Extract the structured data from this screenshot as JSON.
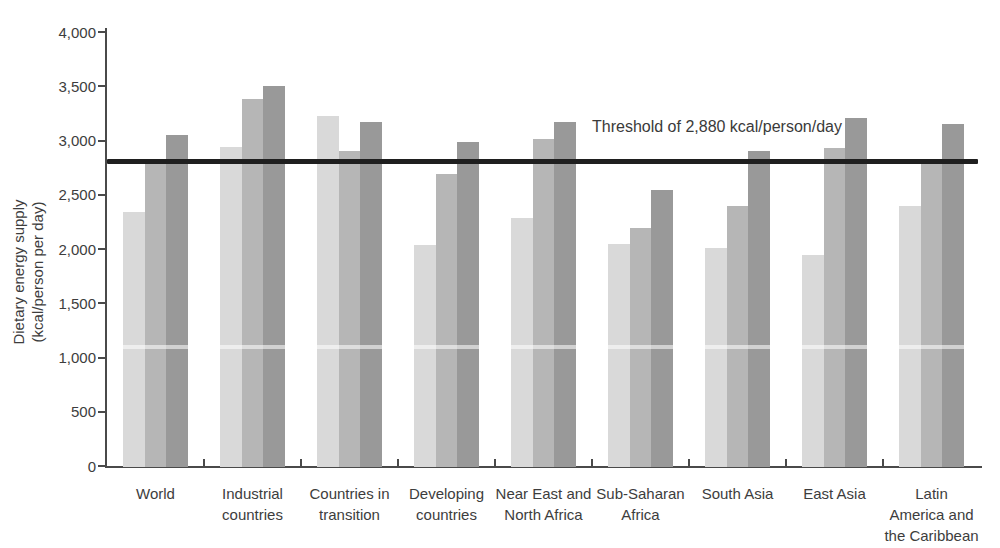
{
  "chart_data": {
    "type": "bar",
    "title": "",
    "xlabel": "",
    "ylabel_lines": [
      "Dietary energy supply",
      "(kcal/person per day)"
    ],
    "ylim": [
      0,
      4000
    ],
    "ytick_step": 500,
    "ytick_labels": [
      "0",
      "500",
      "1,000",
      "1,500",
      "2,000",
      "2,500",
      "3,000",
      "3,500",
      "4,000"
    ],
    "grid": false,
    "legend_position": "none",
    "categories": [
      "World",
      "Industrial\ncountries",
      "Countries in\ntransition",
      "Developing\ncountries",
      "Near East and\nNorth Africa",
      "Sub-Saharan\nAfrica",
      "South Asia",
      "East Asia",
      "Latin\nAmerica and\nthe Caribbean"
    ],
    "series": [
      {
        "name": "series-1-light-gray",
        "color": "#d9d9d9",
        "values": [
          2340,
          2940,
          3230,
          2040,
          2290,
          2050,
          2010,
          1945,
          2395
        ]
      },
      {
        "name": "series-2-medium-gray",
        "color": "#b6b6b6",
        "values": [
          2800,
          3380,
          2900,
          2690,
          3010,
          2190,
          2400,
          2930,
          2820
        ]
      },
      {
        "name": "series-3-dark-gray",
        "color": "#999999",
        "values": [
          3050,
          3500,
          3175,
          2985,
          3170,
          2540,
          2905,
          3210,
          3155
        ]
      }
    ],
    "threshold": {
      "label": "Threshold of 2,880 kcal/person/day",
      "value": 2880,
      "line_value_as_drawn": 2805,
      "line_color": "#1f1f1f"
    },
    "colors": {
      "axis": "#4a4a4a",
      "text": "#3d3d3d",
      "background": "#ffffff"
    }
  }
}
